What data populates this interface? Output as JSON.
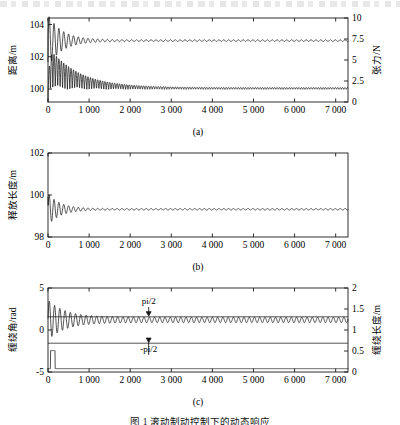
{
  "figure": {
    "caption": "图 1   滚动制动控制下的动态响应",
    "panels": [
      {
        "id": "a",
        "letter": "(a)",
        "xlabel": "t/s",
        "left_axis": {
          "label": "距离/m",
          "ticks": [
            "104",
            "102",
            "100"
          ],
          "min": 99.2,
          "max": 104.4
        },
        "right_axis": {
          "label": "张力/N",
          "ticks": [
            "10",
            "7.5",
            "5",
            "2.5",
            "0"
          ],
          "min": 0,
          "max": 10
        }
      },
      {
        "id": "b",
        "letter": "(b)",
        "xlabel": "t/s",
        "left_axis": {
          "label": "释放长度/m",
          "ticks": [
            "102",
            "100",
            "98"
          ],
          "min": 98,
          "max": 102
        },
        "right_axis": null
      },
      {
        "id": "c",
        "letter": "(c)",
        "xlabel": "t/s",
        "left_axis": {
          "label": "缠绕角/rad",
          "ticks": [
            "5",
            "0",
            "-5"
          ],
          "min": -5,
          "max": 5
        },
        "right_axis": {
          "label": "缠绕长度/m",
          "ticks": [
            "2",
            "1.5",
            "1",
            "0.5",
            "0"
          ],
          "min": 0,
          "max": 2
        },
        "annotations": [
          {
            "text": "pi/2",
            "x": 2450,
            "y": 3.1
          },
          {
            "text": "-pi/2",
            "x": 2450,
            "y": -2.6
          }
        ]
      }
    ],
    "x_ticks": [
      "0",
      "1 000",
      "2 000",
      "3 000",
      "4 000",
      "5 000",
      "6 000",
      "7 000"
    ],
    "x_tick_values": [
      0,
      1000,
      2000,
      3000,
      4000,
      5000,
      6000,
      7000
    ],
    "x_range": [
      0,
      7300
    ]
  },
  "chart_data": {
    "type": "line",
    "title": "图 1   滚动制动控制下的动态响应",
    "xlabel": "t/s",
    "shared_x": {
      "min": 0,
      "max": 7300,
      "ticks": [
        0,
        1000,
        2000,
        3000,
        4000,
        5000,
        6000,
        7000
      ],
      "grid": false
    },
    "subplots": [
      {
        "id": "a",
        "label": "(a)",
        "ylabel": "距离/m",
        "ylim": [
          99.2,
          104.4
        ],
        "y_ticks": [
          104,
          102,
          100
        ],
        "y2label": "张力/N",
        "y2lim": [
          0,
          10
        ],
        "y2_ticks": [
          10,
          7.5,
          5,
          2.5,
          0
        ],
        "legend": null,
        "series": [
          {
            "name": "距离",
            "axis": "left",
            "model": "damped_sine",
            "baseline": 103.0,
            "start": 101.7,
            "amplitude": 1.55,
            "decay_time": 340,
            "period": 118,
            "residual_amplitude": 0.055,
            "residual_period": 118,
            "settle_value": 103.0
          },
          {
            "name": "张力",
            "axis": "right",
            "model": "damped_sine_rectified",
            "baseline": 1.5,
            "start": 0.0,
            "amplitude": 5.0,
            "decay_time": 720,
            "period": 118,
            "residual_amplitude": 0.22,
            "residual_period": 118,
            "settle_value": 1.5
          }
        ]
      },
      {
        "id": "b",
        "label": "(b)",
        "ylabel": "释放长度/m",
        "ylim": [
          98,
          102
        ],
        "y_ticks": [
          102,
          100,
          98
        ],
        "y2label": null,
        "series": [
          {
            "name": "释放长度",
            "axis": "left",
            "model": "damped_sine",
            "baseline": 99.32,
            "start": 99.9,
            "amplitude": 0.72,
            "decay_time": 300,
            "period": 118,
            "residual_amplitude": 0.035,
            "residual_period": 118,
            "settle_value": 99.32
          }
        ]
      },
      {
        "id": "c",
        "label": "(c)",
        "ylabel": "缠绕角/rad",
        "ylim": [
          -5,
          5
        ],
        "y_ticks": [
          5,
          0,
          -5
        ],
        "y2label": "缠绕长度/m",
        "y2lim": [
          0,
          2
        ],
        "y2_ticks": [
          2,
          1.5,
          1,
          0.5,
          0
        ],
        "annotations": [
          {
            "text": "pi/2",
            "x": 2450,
            "y_rad": 3.1,
            "points_to_rad": 1.5708
          },
          {
            "text": "-pi/2",
            "x": 2450,
            "y_rad": -2.6,
            "points_to_rad": -1.5708
          }
        ],
        "reference_lines": [
          {
            "name": "pi/2",
            "value_rad": 1.5708
          },
          {
            "name": "-pi/2",
            "value_rad": -1.5708
          }
        ],
        "series": [
          {
            "name": "缠绕角",
            "axis": "left",
            "model": "damped_sine",
            "baseline": 1.2,
            "start": 1.4,
            "amplitude": 2.05,
            "decay_time": 430,
            "period": 128,
            "residual_amplitude": 0.33,
            "residual_period": 128,
            "settle_value": 1.2
          },
          {
            "name": "缠绕长度",
            "axis": "right",
            "model": "pulse_then_flat",
            "baseline": -4.6,
            "pulse_start": 60,
            "pulse_end": 175,
            "pulse_top": -2.45,
            "settle_value": -4.6
          }
        ]
      }
    ]
  }
}
